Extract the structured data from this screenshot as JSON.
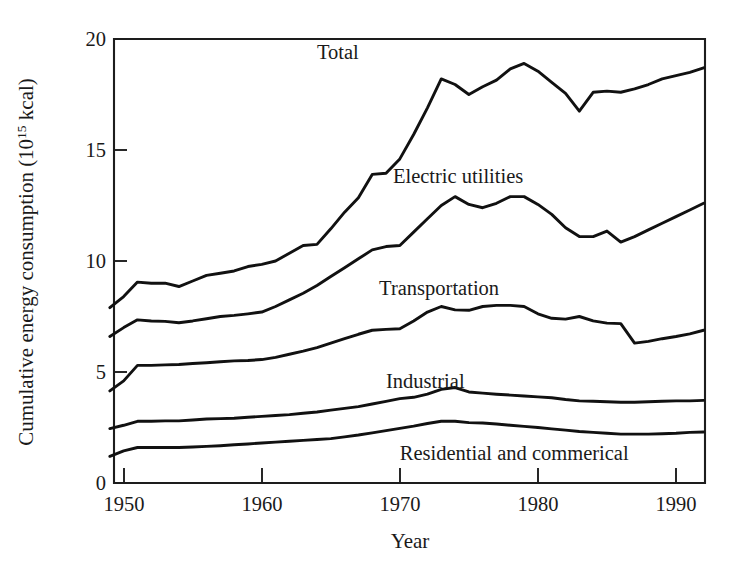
{
  "chart_data": {
    "type": "line",
    "title": "",
    "xlabel": "Year",
    "ylabel": "Cumulative energy consumption (10^15 kcal)",
    "ylabel_main": "Cumulative energy consumption (10",
    "ylabel_exp": "15",
    "ylabel_tail": " kcal)",
    "xlim": [
      1949.3,
      1992.1
    ],
    "ylim": [
      0,
      20
    ],
    "xticks": [
      1950,
      1960,
      1970,
      1980,
      1990
    ],
    "xticklabels": [
      "1950",
      "1960",
      "1970",
      "1980",
      "1990"
    ],
    "yticks": [
      0,
      5,
      10,
      15,
      20
    ],
    "yticklabels": [
      "0",
      "5",
      "10",
      "15",
      "20"
    ],
    "grid": false,
    "legend": "inline-labels",
    "stacked": true,
    "note": "Cumulative (stacked) curves: each upper curve is the running total of the sectors beneath it.",
    "x": [
      1949,
      1950,
      1951,
      1952,
      1953,
      1954,
      1955,
      1956,
      1957,
      1958,
      1959,
      1960,
      1961,
      1962,
      1963,
      1964,
      1965,
      1966,
      1967,
      1968,
      1969,
      1970,
      1971,
      1972,
      1973,
      1974,
      1975,
      1976,
      1977,
      1978,
      1979,
      1980,
      1981,
      1982,
      1983,
      1984,
      1985,
      1986,
      1987,
      1988,
      1989,
      1990,
      1991,
      1992
    ],
    "series": [
      {
        "name": "Residential and commerical",
        "label": "Residential and commerical",
        "label_x": 1970.0,
        "label_y": 1.05,
        "values": [
          1.2,
          1.45,
          1.6,
          1.6,
          1.6,
          1.6,
          1.62,
          1.65,
          1.68,
          1.72,
          1.76,
          1.8,
          1.84,
          1.88,
          1.92,
          1.96,
          2.0,
          2.08,
          2.16,
          2.26,
          2.36,
          2.46,
          2.56,
          2.68,
          2.78,
          2.78,
          2.72,
          2.7,
          2.66,
          2.6,
          2.55,
          2.5,
          2.44,
          2.38,
          2.32,
          2.28,
          2.24,
          2.2,
          2.2,
          2.2,
          2.22,
          2.24,
          2.28,
          2.3
        ]
      },
      {
        "name": "Industrial",
        "label": "Industrial",
        "label_x": 1969.0,
        "label_y": 4.3,
        "values": [
          2.45,
          2.6,
          2.78,
          2.78,
          2.8,
          2.8,
          2.84,
          2.88,
          2.9,
          2.92,
          2.96,
          3.0,
          3.04,
          3.08,
          3.14,
          3.2,
          3.28,
          3.36,
          3.44,
          3.56,
          3.68,
          3.8,
          3.86,
          4.0,
          4.22,
          4.3,
          4.1,
          4.05,
          4.0,
          3.96,
          3.92,
          3.88,
          3.84,
          3.76,
          3.7,
          3.68,
          3.66,
          3.64,
          3.64,
          3.66,
          3.68,
          3.7,
          3.7,
          3.72
        ]
      },
      {
        "name": "Transportation",
        "label": "Transportation",
        "label_x": 1968.5,
        "label_y": 8.45,
        "values": [
          4.15,
          4.6,
          5.3,
          5.3,
          5.32,
          5.34,
          5.38,
          5.42,
          5.46,
          5.5,
          5.52,
          5.56,
          5.66,
          5.8,
          5.94,
          6.1,
          6.3,
          6.5,
          6.7,
          6.88,
          6.92,
          6.95,
          7.3,
          7.7,
          7.95,
          7.8,
          7.78,
          7.95,
          8.0,
          8.0,
          7.95,
          7.62,
          7.42,
          7.38,
          7.5,
          7.3,
          7.2,
          7.18,
          6.3,
          6.38,
          6.5,
          6.6,
          6.72,
          6.88
        ]
      },
      {
        "name": "Electric utilities",
        "label": "Electric utilities",
        "label_x": 1969.5,
        "label_y": 13.5,
        "values": [
          6.6,
          7.0,
          7.35,
          7.3,
          7.28,
          7.22,
          7.3,
          7.4,
          7.5,
          7.55,
          7.62,
          7.7,
          7.95,
          8.25,
          8.55,
          8.9,
          9.3,
          9.7,
          10.1,
          10.5,
          10.65,
          10.7,
          11.3,
          11.9,
          12.5,
          12.9,
          12.55,
          12.4,
          12.6,
          12.9,
          12.9,
          12.55,
          12.1,
          11.5,
          11.1,
          11.1,
          11.35,
          10.85,
          11.1,
          11.4,
          11.7,
          12.0,
          12.3,
          12.6
        ]
      },
      {
        "name": "Total",
        "label": "Total",
        "label_x": 1964.0,
        "label_y": 19.1,
        "values": [
          7.9,
          8.4,
          9.05,
          9.0,
          9.0,
          8.85,
          9.1,
          9.35,
          9.45,
          9.55,
          9.75,
          9.85,
          10.0,
          10.35,
          10.7,
          10.75,
          11.45,
          12.2,
          12.85,
          13.9,
          13.95,
          14.6,
          15.7,
          16.9,
          18.2,
          17.95,
          17.5,
          17.85,
          18.15,
          18.65,
          18.9,
          18.55,
          18.05,
          17.55,
          16.75,
          17.6,
          17.65,
          17.6,
          17.75,
          17.95,
          18.2,
          18.35,
          18.5,
          18.7
        ]
      }
    ]
  },
  "labels": {
    "y_axis_title_prefix": "Cumulative energy consumption (10",
    "y_axis_title_exponent": "15",
    "y_axis_title_suffix": " kcal)",
    "x_axis_title": "Year"
  }
}
